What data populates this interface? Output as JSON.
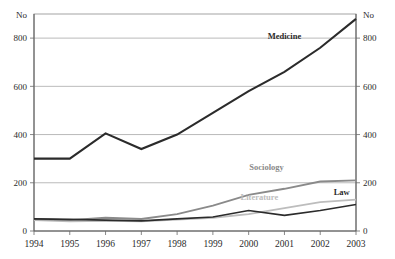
{
  "chart_data": {
    "type": "line",
    "title": "",
    "xlabel": "",
    "ylabel": "No",
    "ylabel_right": "No",
    "categories": [
      "1994",
      "1995",
      "1996",
      "1997",
      "1998",
      "1999",
      "2000",
      "2001",
      "2002",
      "2003"
    ],
    "ylim": [
      0,
      900
    ],
    "yticks": [
      0,
      200,
      400,
      600,
      800
    ],
    "ytick_labels": [
      "0",
      "200",
      "400",
      "600",
      "800"
    ],
    "ytick_labels_right": [
      "0",
      "200",
      "400",
      "600",
      "800"
    ],
    "grid": true,
    "grid_axis": "y",
    "legend_position": "inline-labels",
    "series": [
      {
        "name": "Medicine",
        "color": "#2b2b2b",
        "width": 2.1,
        "label_x": 2001.0,
        "label_y": 795,
        "values": [
          300,
          300,
          405,
          340,
          400,
          490,
          580,
          660,
          760,
          880
        ]
      },
      {
        "name": "Sociology",
        "color": "#8a8a8a",
        "width": 1.9,
        "label_x": 2000.5,
        "label_y": 252,
        "values": [
          50,
          45,
          55,
          50,
          70,
          105,
          150,
          175,
          205,
          210
        ]
      },
      {
        "name": "Literature",
        "color": "#bdbdbd",
        "width": 1.9,
        "label_x": 2000.3,
        "label_y": 128,
        "values": [
          45,
          40,
          42,
          40,
          48,
          55,
          70,
          95,
          120,
          130
        ]
      },
      {
        "name": "Law",
        "color": "#2b2b2b",
        "width": 1.7,
        "label_x": 2002.6,
        "label_y": 148,
        "values": [
          50,
          48,
          45,
          42,
          50,
          58,
          85,
          65,
          85,
          110
        ]
      }
    ]
  },
  "axes": {
    "left_unit": "No",
    "right_unit": "No"
  }
}
